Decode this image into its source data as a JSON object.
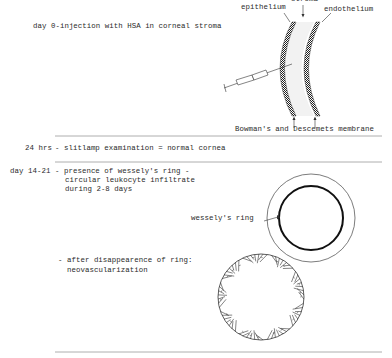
{
  "section_day0": {
    "label": "day 0-injection with HSA in corneal stroma",
    "diagram_labels": {
      "stroma": "stroma",
      "epithelium": "epithelium",
      "endothelium": "endothelium",
      "membranes": "Bowman's and Descemets membrane"
    }
  },
  "section_24hrs": {
    "time": "24 hrs",
    "text": "- slitlamp examination = normal cornea"
  },
  "section_day14": {
    "time": "day 14-21",
    "lines": [
      "- presence of wessely's ring -",
      "circular leukocyte infiltrate",
      "during 2-8 days"
    ],
    "ring_label": "wessely's ring",
    "after_lines": [
      "- after disappearence of ring:",
      "neovascularization"
    ]
  },
  "colors": {
    "ink": "#2a2a2a",
    "rule": "#9a9a9a",
    "stroma_fill": "#f2f2f2"
  }
}
